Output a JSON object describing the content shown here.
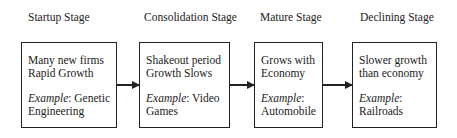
{
  "stages": [
    {
      "title": "Startup Stage",
      "lines": [
        "Many new firms",
        "Rapid Growth"
      ],
      "example_label": "Example",
      "example_text": ": Genetic",
      "example_text2": "Engineering"
    },
    {
      "title": "Consolidation Stage",
      "lines": [
        "Shakeout period",
        "Growth Slows"
      ],
      "example_label": "Example",
      "example_text": ": Video",
      "example_text2": "Games"
    },
    {
      "title": "Mature Stage",
      "lines": [
        "Grows with",
        "Economy"
      ],
      "example_label": "Example",
      "example_text": ":",
      "example_text2": "Automobile"
    },
    {
      "title": "Declining Stage",
      "lines": [
        "Slower growth",
        "than economy"
      ],
      "example_label": "Example",
      "example_text": ":",
      "example_text2": "Railroads"
    }
  ]
}
